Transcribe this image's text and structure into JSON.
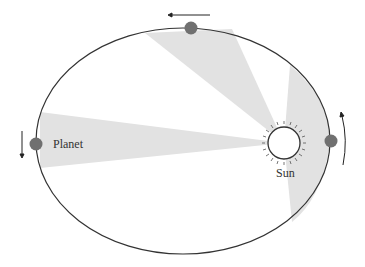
{
  "diagram": {
    "labels": {
      "planet": "Planet",
      "sun": "Sun"
    },
    "elements": {
      "orbit": "elliptical orbit",
      "sectors": [
        "left sector",
        "top sector",
        "right sector"
      ],
      "planet_positions": [
        "left",
        "top",
        "right"
      ],
      "direction_arrows": [
        "down-left",
        "leftward-top",
        "up-right"
      ]
    },
    "colors": {
      "orbit": "#333333",
      "sector_fill": "#e2e2e2",
      "planet": "#707070",
      "sun_outline": "#333333"
    }
  }
}
